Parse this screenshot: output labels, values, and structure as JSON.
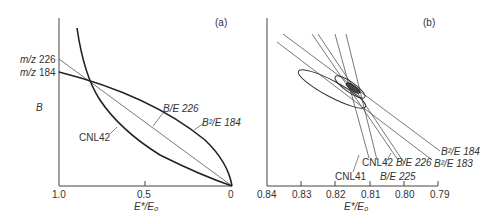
{
  "panel_a": {
    "tag": "(a)",
    "y_label": "B",
    "x_label": "E*/E₀",
    "x_ticks": [
      "1.0",
      "0.5",
      "0"
    ],
    "y_markers": [
      {
        "prefix": "m/z",
        "value": "226"
      },
      {
        "prefix": "m/z",
        "value": "184"
      }
    ],
    "curve_labels": {
      "be226": "B/E 226",
      "b2e184": "B²/E 184",
      "cnl42": "CNL42"
    }
  },
  "panel_b": {
    "tag": "(b)",
    "x_label": "E*/E₀",
    "x_ticks": [
      "0.84",
      "0.83",
      "0.82",
      "0.81",
      "0.80",
      "0.79"
    ],
    "line_labels": {
      "b2e184": "B²/E 184",
      "b2e183": "B²/E 183",
      "cnl42": "CNL42",
      "be226": "B/E 226",
      "cnl41": "CNL41",
      "be225": "B/E 225"
    }
  }
}
